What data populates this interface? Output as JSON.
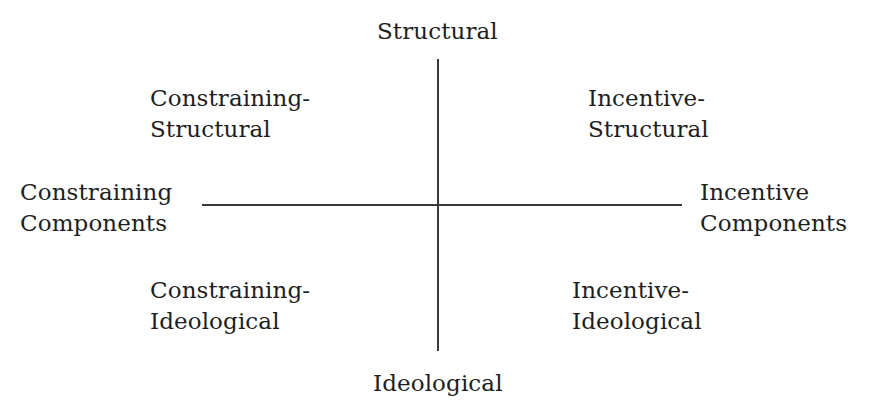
{
  "diagram": {
    "type": "quadrant",
    "axes": {
      "vertical": {
        "top": "Structural",
        "bottom": "Ideological"
      },
      "horizontal": {
        "left": [
          "Constraining",
          "Components"
        ],
        "right": [
          "Incentive",
          "Components"
        ]
      }
    },
    "quadrants": {
      "top_left": [
        "Constraining-",
        "Structural"
      ],
      "top_right": [
        "Incentive-",
        "Structural"
      ],
      "bottom_left": [
        "Constraining-",
        "Ideological"
      ],
      "bottom_right": [
        "Incentive-",
        "Ideological"
      ]
    },
    "colors": {
      "line": "#3a3a3a",
      "text": "#1e1e1e",
      "background": "#ffffff"
    }
  }
}
